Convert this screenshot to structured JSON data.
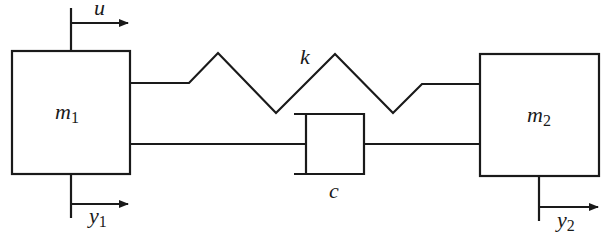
{
  "diagram": {
    "type": "two-mass spring-damper system",
    "masses": [
      {
        "id": "m1",
        "label": "m",
        "subscript": "1"
      },
      {
        "id": "m2",
        "label": "m",
        "subscript": "2"
      }
    ],
    "spring": {
      "label": "k"
    },
    "damper": {
      "label": "c"
    },
    "input": {
      "label": "u"
    },
    "outputs": [
      {
        "label": "y",
        "subscript": "1"
      },
      {
        "label": "y",
        "subscript": "2"
      }
    ],
    "colors": {
      "stroke": "#1a1a1a",
      "background": "#ffffff"
    }
  }
}
